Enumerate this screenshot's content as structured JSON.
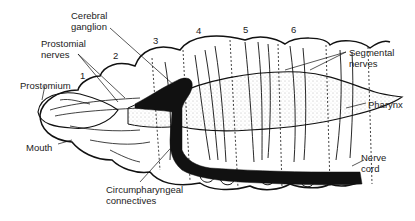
{
  "labels": {
    "cerebral_ganglion": [
      "Cerebral",
      "ganglion"
    ],
    "prostomial_nerves": [
      "Prostomial",
      "nerves"
    ],
    "prostomium": "Prostomium",
    "mouth": "Mouth",
    "circumpharyngeal_connectives": [
      "Circumpharyngeal",
      "connectives"
    ],
    "segmental_nerves": [
      "Segmental",
      "nerves"
    ],
    "pharynx": "Pharynx",
    "nerve_cord": [
      "Nerve",
      "cord"
    ]
  },
  "segments": [
    "1",
    "2",
    "3",
    "4",
    "5",
    "6"
  ],
  "colors": {
    "ink": "#111111",
    "stipple": "#9a9a9a",
    "background": "#ffffff"
  }
}
